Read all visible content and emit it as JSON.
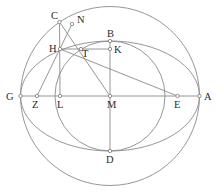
{
  "diagram": {
    "type": "geometric-construction",
    "colors": {
      "stroke": "#8a8a8a",
      "label": "#2a2a2a",
      "background": "#ffffff"
    },
    "curves": [
      {
        "id": "outer-circle",
        "kind": "circle",
        "cx": 110,
        "cy": 96,
        "r": 89.5
      },
      {
        "id": "ellipse",
        "kind": "ellipse",
        "cx": 110,
        "cy": 96,
        "rx": 89.5,
        "ry": 55
      },
      {
        "id": "inner-circle",
        "kind": "circle",
        "cx": 110,
        "cy": 96,
        "r": 55
      }
    ],
    "segments": [
      {
        "id": "GA",
        "from": "G",
        "to": "A"
      },
      {
        "id": "BD",
        "from": "B",
        "to": "D"
      },
      {
        "id": "CL",
        "from": "C",
        "to": "L"
      },
      {
        "id": "HK",
        "from": "H",
        "to": "K"
      },
      {
        "id": "HE",
        "from": "H",
        "to": "E"
      },
      {
        "id": "ZN",
        "from": "Z",
        "to": "N"
      },
      {
        "id": "CM",
        "from": "C",
        "to": "M"
      }
    ],
    "points": [
      {
        "name": "C",
        "x": 59.5,
        "y": 22,
        "lx": 51,
        "ly": 19
      },
      {
        "name": "N",
        "x": 72,
        "y": 24,
        "lx": 77,
        "ly": 23
      },
      {
        "name": "B",
        "x": 110,
        "y": 41,
        "lx": 107,
        "ly": 37
      },
      {
        "name": "H",
        "x": 60,
        "y": 49,
        "lx": 49,
        "ly": 52
      },
      {
        "name": "T",
        "x": 81,
        "y": 49,
        "lx": 82,
        "ly": 57
      },
      {
        "name": "K",
        "x": 110,
        "y": 49,
        "lx": 114,
        "ly": 53
      },
      {
        "name": "G",
        "x": 20.5,
        "y": 96,
        "lx": 6,
        "ly": 100
      },
      {
        "name": "Z",
        "x": 37,
        "y": 96,
        "lx": 32,
        "ly": 108
      },
      {
        "name": "L",
        "x": 60,
        "y": 96,
        "lx": 57,
        "ly": 108
      },
      {
        "name": "M",
        "x": 110,
        "y": 96,
        "lx": 107,
        "ly": 108
      },
      {
        "name": "E",
        "x": 177.5,
        "y": 96,
        "lx": 174,
        "ly": 108
      },
      {
        "name": "A",
        "x": 199.5,
        "y": 96,
        "lx": 204,
        "ly": 100
      },
      {
        "name": "D",
        "x": 110,
        "y": 151,
        "lx": 106,
        "ly": 163
      }
    ]
  }
}
